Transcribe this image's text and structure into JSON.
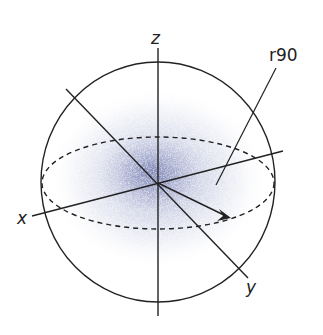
{
  "diagram": {
    "type": "3d-sphere-axes",
    "labels": {
      "z_axis": "z",
      "x_axis": "x",
      "y_axis": "y",
      "radius_annotation": "r90"
    },
    "colors": {
      "stroke": "#222222",
      "cloud": "#8088b8",
      "background": "#ffffff"
    }
  }
}
